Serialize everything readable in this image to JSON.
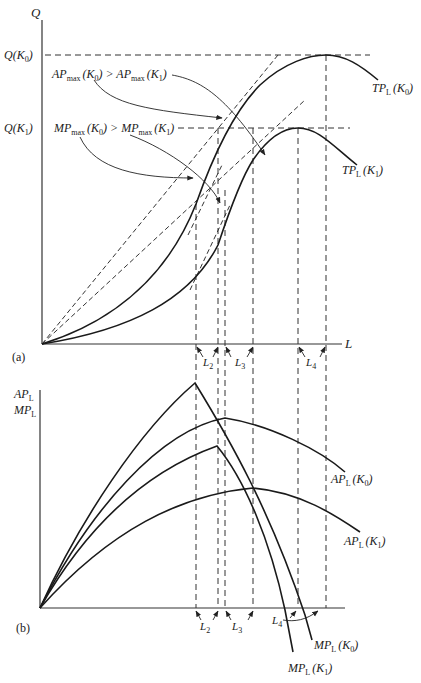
{
  "figure": {
    "panel_a": {
      "tag": "(a)",
      "y_axis_label": "Q",
      "x_axis_label": "L",
      "q_k0_label": "Q(K",
      "q_k0_sub": "0",
      "q_k1_label": "Q(K",
      "q_k1_sub": "1",
      "ap_annotation": {
        "left": "AP",
        "left_sub": "max",
        "left_k": "(K",
        "left_k_sub": "0",
        "mid": ") > AP",
        "right_sub": "max",
        "right_k": "(K",
        "right_k_sub": "1",
        "end": ")"
      },
      "mp_annotation": {
        "left": "MP",
        "left_sub": "max",
        "left_k": "(K",
        "left_k_sub": "0",
        "mid": ") > MP",
        "right_sub": "max",
        "right_k": "(K",
        "right_k_sub": "1",
        "end": ")"
      },
      "tp_k0": {
        "name": "TP",
        "sub": "L",
        "k": "(K",
        "k_sub": "0",
        "end": ")"
      },
      "tp_k1": {
        "name": "TP",
        "sub": "L",
        "k": "(K",
        "k_sub": "1",
        "end": ")"
      },
      "l_markers": [
        {
          "name": "L",
          "sub": "2"
        },
        {
          "name": "L",
          "sub": "3"
        },
        {
          "name": "L",
          "sub": "4"
        }
      ]
    },
    "panel_b": {
      "tag": "(b)",
      "y_axis_label_1": "AP",
      "y_axis_label_1_sub": "L",
      "y_axis_label_2": "MP",
      "y_axis_label_2_sub": "L",
      "ap_k0": {
        "name": "AP",
        "sub": "L",
        "k": "(K",
        "k_sub": "0",
        "end": ")"
      },
      "ap_k1": {
        "name": "AP",
        "sub": "L",
        "k": "(K",
        "k_sub": "1",
        "end": ")"
      },
      "mp_k0": {
        "name": "MP",
        "sub": "L",
        "k": "(K",
        "k_sub": "0",
        "end": ")"
      },
      "mp_k1": {
        "name": "MP",
        "sub": "L",
        "k": "(K",
        "k_sub": "1",
        "end": ")"
      },
      "l_markers": [
        {
          "name": "L",
          "sub": "2"
        },
        {
          "name": "L",
          "sub": "3"
        },
        {
          "name": "L",
          "sub": "4"
        }
      ]
    }
  }
}
